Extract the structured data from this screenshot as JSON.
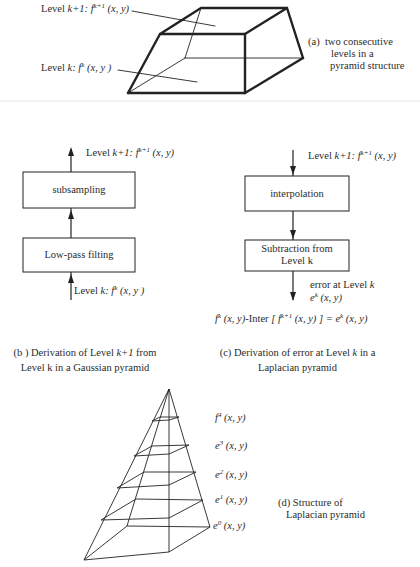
{
  "panel_a": {
    "label_top_prefix": "Level ",
    "label_top_var": "k+1:",
    "label_top_f": " f",
    "label_top_sup": "k+1",
    "label_top_args": " (x, y)",
    "label_bottom_prefix": "Level ",
    "label_bottom_var": "k:",
    "label_bottom_f": " f",
    "label_bottom_sup": "k",
    "label_bottom_args": " (x, y )",
    "caption_marker": "(a)",
    "caption_lines": [
      "two consecutive",
      "levels in a",
      "pyramid structure"
    ]
  },
  "panel_b": {
    "output_prefix": "Level ",
    "output_var": "k+1:",
    "output_f": " f",
    "output_sup": "k+1",
    "output_args": " (x, y)",
    "box_top": "subsampling",
    "box_bottom": "Low-pass filting",
    "input_prefix": "Level ",
    "input_var": "k:",
    "input_f": " f",
    "input_sup": "k",
    "input_args": " (x, y )",
    "caption_line1_a": "(b ) Derivation of Level ",
    "caption_line1_var": "k+1",
    "caption_line1_b": " from",
    "caption_line2": "Level k in a Gaussian pyramid"
  },
  "panel_c": {
    "input_prefix": "Level ",
    "input_var": "k+1:",
    "input_f": " f",
    "input_sup": "k+1",
    "input_args": " (x, y)",
    "box_top": "interpolation",
    "box_bottom_line1": "Subtraction from",
    "box_bottom_line2": "Level k",
    "output_line1_a": "error at Level ",
    "output_line1_var": "k",
    "output_e": "e",
    "output_sup": "k",
    "output_args": " (x, y)",
    "equation_f": "f",
    "equation_f_sup": "k",
    "equation_part1": " (x, y)",
    "equation_mid": "-Inter ",
    "equation_bracket_open": "[ f",
    "equation_inner_sup": "k+1",
    "equation_inner_args": " (x, y) ]",
    "equation_eq": " = e",
    "equation_e_sup": "k",
    "equation_end": " (x, y)",
    "caption_line1_a": "(c) Derivation of  error at Level ",
    "caption_line1_var": "k",
    "caption_line1_b": " in a",
    "caption_line2": "Laplacian pyramid"
  },
  "panel_d": {
    "levels": [
      {
        "sym": "f",
        "sup": "4",
        "args": " (x, y)"
      },
      {
        "sym": "e",
        "sup": "3",
        "args": " (x, y)"
      },
      {
        "sym": "e",
        "sup": "2",
        "args": " (x, y)"
      },
      {
        "sym": "e",
        "sup": "1",
        "args": " (x, y)"
      },
      {
        "sym": "e",
        "sup": "0",
        "args": " (x, y)"
      }
    ],
    "caption_line1": "(d) Structure of",
    "caption_line2": "Laplacian pyramid"
  },
  "colors": {
    "line": "#222222",
    "separator": "#e4e4e4"
  }
}
